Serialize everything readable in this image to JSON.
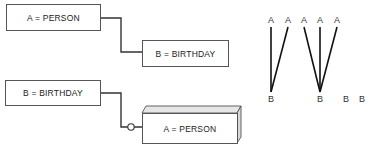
{
  "diagram1": {
    "parent": "A = PERSON",
    "child": "B = BIRTHDAY"
  },
  "diagram2": {
    "parent": "B = BIRTHDAY",
    "child": "A = PERSON"
  },
  "mapping": {
    "top_labels": [
      "A",
      "A",
      "A",
      "A",
      "A"
    ],
    "bottom_labels": [
      "B",
      "B",
      "B",
      "B"
    ]
  }
}
